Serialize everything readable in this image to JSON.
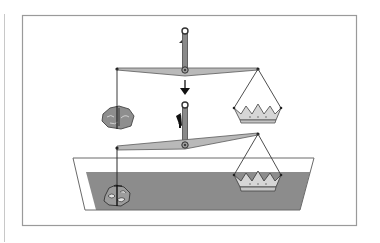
{
  "figure": {
    "states": [
      {
        "name": "in-air",
        "label": "Balance in air",
        "beam": "level"
      },
      {
        "name": "in-water",
        "label": "Balance immersed in water",
        "beam": "tilted"
      }
    ],
    "objects": [
      {
        "name": "rock",
        "label": "Ore"
      },
      {
        "name": "crown",
        "label": "Crown"
      }
    ],
    "icons": {
      "down_arrow": "arrow-down-icon",
      "up_arrow": "arrow-up-icon"
    },
    "colors": {
      "background": "#ffffff",
      "frame": "#9a9a9a",
      "beam_fill": "#b9b9b9",
      "beam_stroke": "#5a5a5a",
      "water": "#8c8c8c",
      "tank_stroke": "#6a6a6a",
      "crown_fill": "#d6d6d6",
      "rock_fill": "#8e8e8e",
      "string": "#3a3a3a"
    }
  }
}
